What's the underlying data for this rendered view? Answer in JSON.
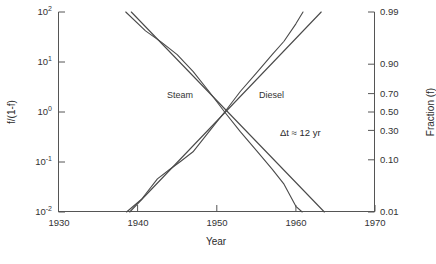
{
  "chart_data": {
    "type": "line",
    "title": "",
    "subtitle": "",
    "xlabel": "Year",
    "ylabel_left": "f/(1-f)",
    "ylabel_right": "Fraction (f)",
    "xlim": [
      1930,
      1970
    ],
    "xticks": [
      1930,
      1940,
      1950,
      1960,
      1970
    ],
    "xticklabels": [
      "1930",
      "1940",
      "1950",
      "1960",
      "1970"
    ],
    "ylim_left": [
      0.01,
      100
    ],
    "yscale": "log",
    "yticks_left": [
      0.01,
      0.1,
      1,
      10,
      100
    ],
    "yticklabels_left": [
      "10-2",
      "10-1",
      "100",
      "101",
      "102"
    ],
    "yticklabels_left_display": [
      {
        "base": "10",
        "exp": "-2"
      },
      {
        "base": "10",
        "exp": "-1"
      },
      {
        "base": "10",
        "exp": "0"
      },
      {
        "base": "10",
        "exp": "1"
      },
      {
        "base": "10",
        "exp": "2"
      }
    ],
    "yticks_right_fraction": [
      0.01,
      0.1,
      0.3,
      0.5,
      0.7,
      0.9,
      0.99
    ],
    "yticklabels_right": [
      "0.01",
      "0.10",
      "0.30",
      "0.50",
      "0.70",
      "0.90",
      "0.99"
    ],
    "grid": false,
    "legend_position": "inline-annotations",
    "annotations": [
      {
        "name": "delta-t",
        "text": "Δt ≈ 12 yr",
        "x": 1959.0,
        "y_fraction": 0.34
      }
    ],
    "series": [
      {
        "name": "Steam",
        "label": "Steam",
        "kind": "data",
        "color": "#4a4a4a",
        "points": [
          {
            "x": 1938.5,
            "f_over_1mf": 100.0
          },
          {
            "x": 1941.0,
            "f_over_1mf": 42.0
          },
          {
            "x": 1943.0,
            "f_over_1mf": 25.0
          },
          {
            "x": 1945.0,
            "f_over_1mf": 14.0
          },
          {
            "x": 1947.0,
            "f_over_1mf": 6.5
          },
          {
            "x": 1949.0,
            "f_over_1mf": 2.6
          },
          {
            "x": 1951.0,
            "f_over_1mf": 1.0
          },
          {
            "x": 1953.0,
            "f_over_1mf": 0.4
          },
          {
            "x": 1955.0,
            "f_over_1mf": 0.17
          },
          {
            "x": 1957.0,
            "f_over_1mf": 0.072
          },
          {
            "x": 1958.5,
            "f_over_1mf": 0.036
          },
          {
            "x": 1960.0,
            "f_over_1mf": 0.013
          },
          {
            "x": 1960.8,
            "f_over_1mf": 0.01
          }
        ]
      },
      {
        "name": "Steam fit",
        "label": "",
        "kind": "fit",
        "color": "#4a4a4a",
        "points": [
          {
            "x": 1939.2,
            "f_over_1mf": 100.0
          },
          {
            "x": 1963.6,
            "f_over_1mf": 0.01
          }
        ]
      },
      {
        "name": "Diesel",
        "label": "Diesel",
        "kind": "data",
        "color": "#4a4a4a",
        "points": [
          {
            "x": 1938.6,
            "f_over_1mf": 0.01
          },
          {
            "x": 1940.5,
            "f_over_1mf": 0.018
          },
          {
            "x": 1942.5,
            "f_over_1mf": 0.046
          },
          {
            "x": 1944.0,
            "f_over_1mf": 0.07
          },
          {
            "x": 1945.5,
            "f_over_1mf": 0.105
          },
          {
            "x": 1947.0,
            "f_over_1mf": 0.16
          },
          {
            "x": 1949.0,
            "f_over_1mf": 0.4
          },
          {
            "x": 1951.0,
            "f_over_1mf": 1.0
          },
          {
            "x": 1953.0,
            "f_over_1mf": 2.6
          },
          {
            "x": 1955.0,
            "f_over_1mf": 6.0
          },
          {
            "x": 1957.0,
            "f_over_1mf": 14.0
          },
          {
            "x": 1958.5,
            "f_over_1mf": 26.0
          },
          {
            "x": 1960.0,
            "f_over_1mf": 58.0
          },
          {
            "x": 1960.9,
            "f_over_1mf": 100.0
          }
        ]
      },
      {
        "name": "Diesel fit",
        "label": "",
        "kind": "fit",
        "color": "#4a4a4a",
        "points": [
          {
            "x": 1939.0,
            "f_over_1mf": 0.01
          },
          {
            "x": 1963.2,
            "f_over_1mf": 100.0
          }
        ]
      }
    ],
    "series_labels": [
      {
        "name": "steam-label",
        "text": "Steam",
        "x_px": 167,
        "y_px": 95
      },
      {
        "name": "diesel-label",
        "text": "Diesel",
        "x_px": 259,
        "y_px": 95
      }
    ]
  },
  "axes": {
    "x_title": "Year",
    "y_left_title": "f/(1-f)",
    "y_right_title": "Fraction (f)"
  }
}
